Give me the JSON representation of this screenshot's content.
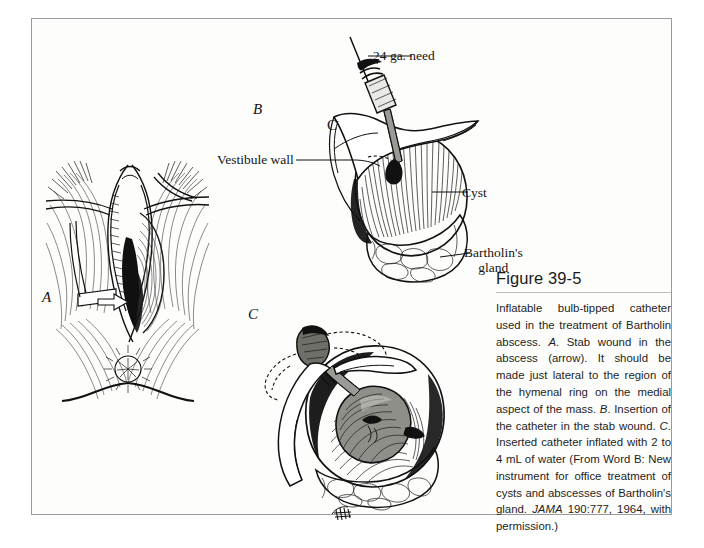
{
  "figure": {
    "title": "Figure 39-5",
    "caption_runs": [
      {
        "text": "Inflatable bulb-tipped catheter used in the treatment of Bartholin abscess. ",
        "style": "normal"
      },
      {
        "text": "A",
        "style": "italic"
      },
      {
        "text": ". Stab wound in the abscess (arrow). It should be made just lateral to the region of the hymenal ring on the medial aspect of the mass. ",
        "style": "normal"
      },
      {
        "text": "B",
        "style": "italic"
      },
      {
        "text": ". Insertion of the catheter in the stab wound. ",
        "style": "normal"
      },
      {
        "text": "C",
        "style": "italic"
      },
      {
        "text": ". Inserted catheter inflated with 2 to 4 mL of water (From Word B: New instrument for office treatment of cysts and abscesses of Bartholin's gland. ",
        "style": "normal"
      },
      {
        "text": "JAMA",
        "style": "italic"
      },
      {
        "text": " 190:777, 1964, with permission.)",
        "style": "normal"
      }
    ]
  },
  "panels": [
    {
      "id": "a",
      "letter": "A",
      "name": "stab-wound-in-abscess"
    },
    {
      "id": "b",
      "letter": "B",
      "name": "insertion-of-catheter"
    },
    {
      "id": "c",
      "letter": "C",
      "name": "inflated-catheter"
    }
  ],
  "annotations": {
    "needle": "24 ga. need",
    "vestibule_wall": "Vestibule wall",
    "cyst": "Cyst",
    "bartholins_gland_line1": "Bartholin's",
    "bartholins_gland_line2": "gland",
    "catheter_marker": "C"
  },
  "colors": {
    "ink": "#111111",
    "page_border": "#9a9a9a",
    "page_background": "#fdfdfc",
    "rule": "#bdbdbd",
    "caption_text": "#1d1d1d"
  }
}
